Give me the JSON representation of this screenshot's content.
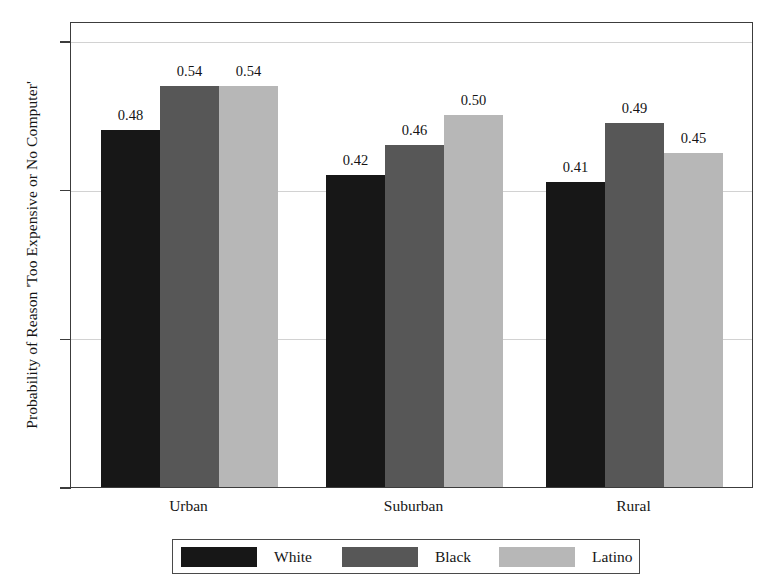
{
  "chart_data": {
    "type": "bar",
    "title": "",
    "subtitle": "",
    "xlabel": "",
    "ylabel": "Probability of Reason 'Too Expensive or No Computer'",
    "categories": [
      "Urban",
      "Suburban",
      "Rural"
    ],
    "series": [
      {
        "name": "White",
        "color": "#171717",
        "values": [
          0.48,
          0.42,
          0.41
        ],
        "labels": [
          "0.48",
          "0.42",
          "0.41"
        ]
      },
      {
        "name": "Black",
        "color": "#575757",
        "values": [
          0.54,
          0.46,
          0.49
        ],
        "labels": [
          "0.54",
          "0.46",
          "0.49"
        ]
      },
      {
        "name": "Latino",
        "color": "#b7b7b7",
        "values": [
          0.54,
          0.5,
          0.45
        ],
        "labels": [
          "0.54",
          "0.50",
          "0.45"
        ]
      }
    ],
    "ylim": [
      0,
      0.6
    ],
    "yticks": [
      0,
      0.2,
      0.4,
      0.6
    ],
    "ytick_labels": [
      "0",
      ".2",
      ".4",
      ".6"
    ],
    "grid": true,
    "grid_axis": "y",
    "legend_position": "bottom",
    "bar_edge": "none",
    "background": "#ffffff",
    "frame_color": "#3c3c3c"
  }
}
